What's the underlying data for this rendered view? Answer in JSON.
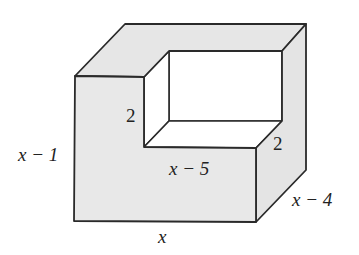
{
  "diagram": {
    "type": "3d-solid-l-shaped-block",
    "colors": {
      "face_fill": "#e8e8e8",
      "top_fill": "#e6e6e6",
      "side_fill": "#e4e4e4",
      "cutout_fill": "#ffffff",
      "stroke": "#2a2a2a",
      "label": "#222222"
    },
    "labels": {
      "height": "x − 1",
      "width": "x",
      "depth": "x − 4",
      "step_width": "x − 5",
      "cut_height": "2",
      "cut_depth": "2"
    }
  }
}
